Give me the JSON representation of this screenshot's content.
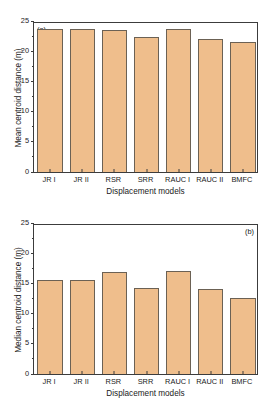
{
  "chart_data": [
    {
      "type": "bar",
      "panel_label": "(a)",
      "panel_label_position": "top-left",
      "title": "",
      "xlabel": "Displacement models",
      "ylabel": "Mean centroid distance (m)",
      "categories": [
        "JR I",
        "JR II",
        "RSR",
        "SRR",
        "RAUC I",
        "RAUC II",
        "BMFC"
      ],
      "values": [
        23.6,
        23.6,
        23.5,
        22.3,
        23.6,
        22.1,
        21.5
      ],
      "ylim": [
        0,
        25
      ],
      "yticks": [
        0,
        5,
        10,
        15,
        20,
        25
      ],
      "ytick_labels": [
        "0",
        "5",
        "10",
        "15",
        "20",
        "25"
      ],
      "yminor_ticks": [
        2.5,
        7.5,
        12.5,
        17.5,
        22.5
      ],
      "grid": false,
      "legend": false,
      "bar_color": "#EFBE8C",
      "bar_edge_color": "#6b6154"
    },
    {
      "type": "bar",
      "panel_label": "(b)",
      "panel_label_position": "top-right",
      "title": "",
      "xlabel": "Displacement models",
      "ylabel": "Median centroid distance (m)",
      "categories": [
        "JR I",
        "JR II",
        "RSR",
        "SRR",
        "RAUC I",
        "RAUC II",
        "BMFC"
      ],
      "values": [
        15.5,
        15.5,
        16.9,
        14.3,
        17.0,
        14.1,
        12.6
      ],
      "ylim": [
        0,
        25
      ],
      "yticks": [
        0,
        5,
        10,
        15,
        20,
        25
      ],
      "ytick_labels": [
        "0",
        "5",
        "10",
        "15",
        "20",
        "25"
      ],
      "yminor_ticks": [
        2.5,
        7.5,
        12.5,
        17.5,
        22.5
      ],
      "grid": false,
      "legend": false,
      "bar_color": "#EFBE8C",
      "bar_edge_color": "#6b6154"
    }
  ]
}
